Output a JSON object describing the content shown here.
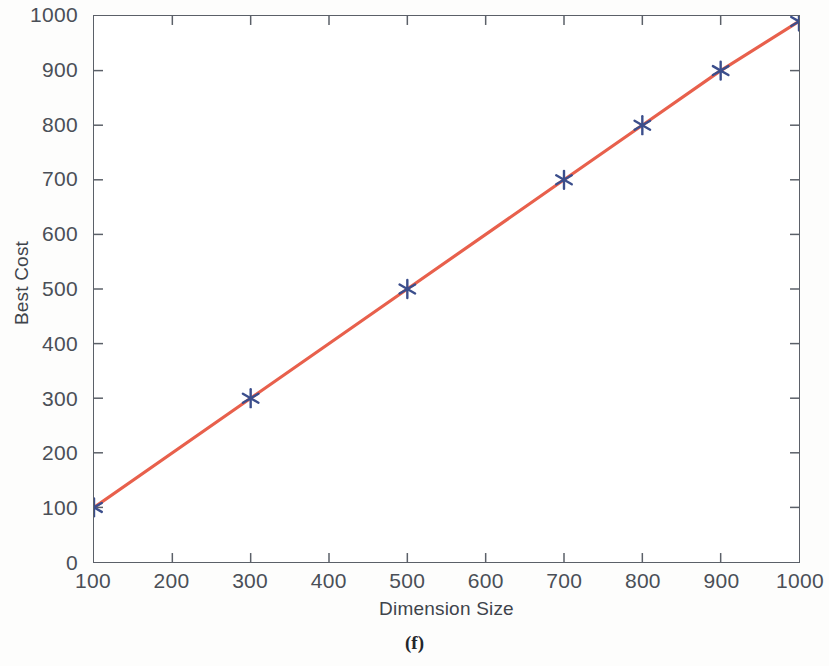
{
  "figure": {
    "caption": "(f)",
    "background_color": "#fdfdfc"
  },
  "axes": {
    "x_title": "Dimension Size",
    "y_title": "Best Cost",
    "frame_color": "#5b6068"
  },
  "chart_data": {
    "type": "line",
    "title": "",
    "subtitle": "",
    "xlabel": "Dimension Size",
    "ylabel": "Best Cost",
    "xlim": [
      100,
      1000
    ],
    "ylim": [
      0,
      1000
    ],
    "grid": false,
    "legend": null,
    "xticks": [
      100,
      200,
      300,
      400,
      500,
      600,
      700,
      800,
      900,
      1000
    ],
    "xtick_labels": [
      "100",
      "200",
      "300",
      "400",
      "500",
      "600",
      "700",
      "800",
      "900",
      "1000"
    ],
    "yticks": [
      0,
      100,
      200,
      300,
      400,
      500,
      600,
      700,
      800,
      900,
      1000
    ],
    "ytick_labels": [
      "0",
      "100",
      "200",
      "300",
      "400",
      "500",
      "600",
      "700",
      "800",
      "900",
      "1000"
    ],
    "series": [
      {
        "name": "Best Cost",
        "line_color": "#E8604C",
        "marker_color": "#3B4E8C",
        "marker": "asterisk",
        "x": [
          100,
          300,
          500,
          700,
          800,
          900,
          1000
        ],
        "values": [
          100,
          300,
          500,
          700,
          800,
          900,
          990
        ]
      }
    ]
  }
}
